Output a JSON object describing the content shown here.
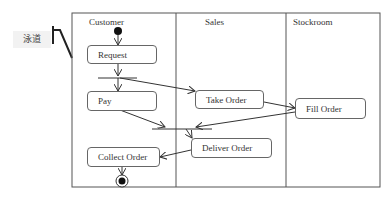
{
  "callout": {
    "label": "泳道"
  },
  "lanes": [
    {
      "title": "Customer"
    },
    {
      "title": "Sales"
    },
    {
      "title": "Stockroom"
    }
  ],
  "nodes": {
    "request": "Request",
    "pay": "Pay",
    "collect_order": "Collect Order",
    "take_order": "Take Order",
    "deliver_order": "Deliver Order",
    "fill_order": "Fill Order"
  },
  "colors": {
    "line": "#333333",
    "border": "#666666",
    "callout_bg": "#f2f2f2"
  }
}
